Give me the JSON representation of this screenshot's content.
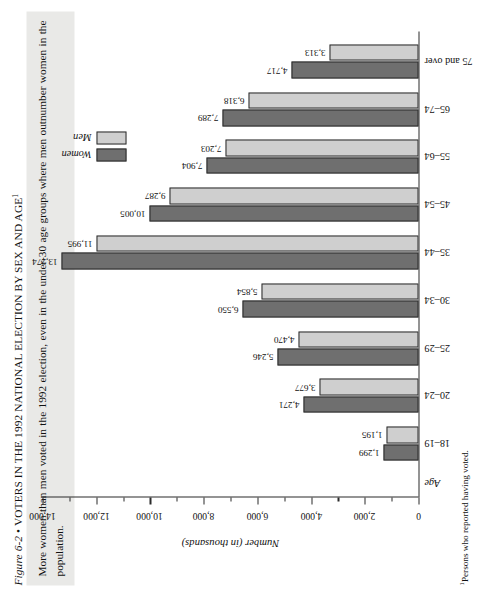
{
  "figure": {
    "number": "Figure 6-2",
    "bullet": "•",
    "title": "VOTERS IN THE 1992 NATIONAL ELECTION BY SEX AND AGE",
    "title_footnote_marker": "1",
    "caption": "More women than men voted in the 1992 election, even in the under-30 age groups where men outnumber women in the population.",
    "footnote_marker": "1",
    "footnote": "Persons who reported having voted."
  },
  "colors": {
    "women": "#6f6f6f",
    "men": "#cfcfcf",
    "axis": "#2b2b2b",
    "caption_bg": "#e9e9e7",
    "page_bg": "#ffffff"
  },
  "legend": {
    "position": "upper-right",
    "entries": [
      {
        "label": "Women",
        "color": "#6f6f6f"
      },
      {
        "label": "Men",
        "color": "#cfcfcf"
      }
    ]
  },
  "axes": {
    "category_axis_title": "Age",
    "value_axis_title": "Number (in thousands)",
    "value_ticks": [
      "0",
      "2,000",
      "4,000",
      "6,000",
      "8,000",
      "10,000",
      "12,000",
      "14,000"
    ],
    "value_min": 0,
    "value_max": 14000,
    "minor_tick_step": 1000
  },
  "chart_data": {
    "type": "bar",
    "title": "VOTERS IN THE 1992 NATIONAL ELECTION BY SEX AND AGE",
    "xlabel": "Age",
    "ylabel": "Number (in thousands)",
    "ylim": [
      0,
      14000
    ],
    "grid": false,
    "legend_position": "upper right",
    "categories": [
      "18–19",
      "20–24",
      "25–29",
      "30–34",
      "35–44",
      "45–54",
      "55–64",
      "65–74",
      "75 and over"
    ],
    "series": [
      {
        "name": "Women",
        "color": "#6f6f6f",
        "values": [
          1299,
          4271,
          5246,
          6550,
          13274,
          10005,
          7904,
          7289,
          4717
        ],
        "labels": [
          "1,299",
          "4,271",
          "5,246",
          "6,550",
          "13,274",
          "10,005",
          "7,904",
          "7,289",
          "4,717"
        ]
      },
      {
        "name": "Men",
        "color": "#cfcfcf",
        "values": [
          1195,
          3677,
          4470,
          5854,
          11995,
          9287,
          7203,
          6318,
          3313
        ],
        "labels": [
          "1,195",
          "3,677",
          "4,470",
          "5,854",
          "11,995",
          "9,287",
          "7,203",
          "6,318",
          "3,313"
        ]
      }
    ]
  }
}
